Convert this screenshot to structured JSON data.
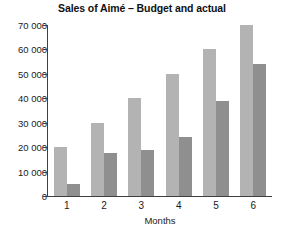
{
  "chart_data": {
    "type": "bar",
    "title": "Sales of Aimé – Budget and actual",
    "xlabel": "Months",
    "ylabel": "",
    "categories": [
      "1",
      "2",
      "3",
      "4",
      "5",
      "6"
    ],
    "series": [
      {
        "name": "Budget",
        "color": "#b3b3b3",
        "values": [
          20000,
          30000,
          40000,
          50000,
          60000,
          70000
        ]
      },
      {
        "name": "Actual",
        "color": "#8f8f8f",
        "values": [
          5000,
          17500,
          19000,
          24000,
          39000,
          54000
        ]
      }
    ],
    "ylim": [
      0,
      70000
    ],
    "ytick_values": [
      0,
      10000,
      20000,
      30000,
      40000,
      50000,
      60000,
      70000
    ],
    "ytick_labels": [
      "0",
      "10 000",
      "20 000",
      "30 000",
      "40 000",
      "50 000",
      "60 000",
      "70 000"
    ],
    "grid": false,
    "legend": false
  }
}
